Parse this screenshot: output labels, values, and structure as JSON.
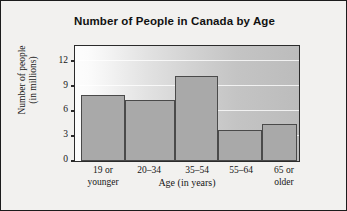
{
  "chart_data": {
    "type": "bar",
    "title": "Number of People in Canada by Age",
    "xlabel": "Age (in years)",
    "ylabel": "Number of people (in millions)",
    "ylabel_line1": "Number of people",
    "ylabel_line2": "(in millions)",
    "categories": [
      "19 or younger",
      "20–34",
      "35–54",
      "55–64",
      "65 or older"
    ],
    "category_lines": [
      [
        "19 or",
        "younger"
      ],
      [
        "20–34",
        ""
      ],
      [
        "35–54",
        ""
      ],
      [
        "55–64",
        ""
      ],
      [
        "65 or",
        "older"
      ]
    ],
    "values": [
      8.0,
      7.4,
      10.3,
      3.8,
      4.5
    ],
    "ylim": [
      0,
      13.8
    ],
    "yticks": [
      0,
      3,
      6,
      9,
      12
    ],
    "ytick_labels": [
      "0",
      "3",
      "6",
      "9",
      "12"
    ],
    "grid": true,
    "grid_axis": "y",
    "legend": "none",
    "bar_fill_color": "#a9a9a9",
    "bar_edge_color": "#4a4a4a",
    "frame_color": "#2b2b2b",
    "text_color": "#161616",
    "background_color": "#f2f1ef"
  }
}
